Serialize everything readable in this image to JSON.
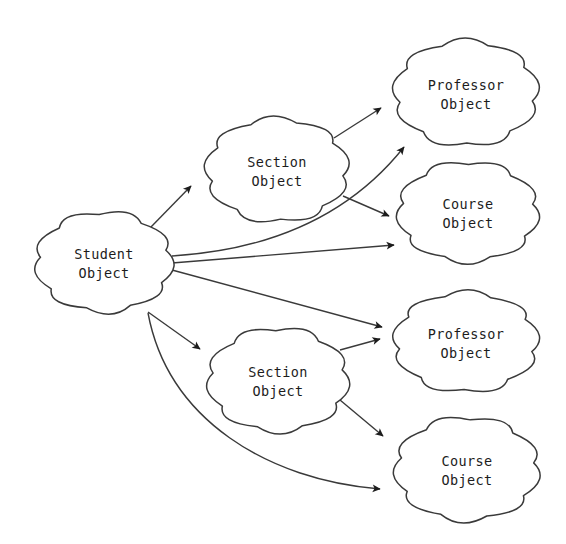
{
  "diagram": {
    "background_color": "#ffffff",
    "stroke_color": "#3a3a3a",
    "text_color": "#1c1c1c",
    "nodes": [
      {
        "id": "student",
        "line1": "Student",
        "line2": "Object",
        "cx": 104,
        "cy": 262,
        "rx": 76,
        "ry": 58
      },
      {
        "id": "section-top",
        "line1": "Section",
        "line2": "Object",
        "cx": 277,
        "cy": 170,
        "rx": 79,
        "ry": 60
      },
      {
        "id": "section-bottom",
        "line1": "Section",
        "line2": "Object",
        "cx": 278,
        "cy": 380,
        "rx": 78,
        "ry": 60
      },
      {
        "id": "professor-top",
        "line1": "Professor",
        "line2": "Object",
        "cx": 466,
        "cy": 93,
        "rx": 80,
        "ry": 61
      },
      {
        "id": "course-top",
        "line1": "Course",
        "line2": "Object",
        "cx": 468,
        "cy": 212,
        "rx": 78,
        "ry": 58
      },
      {
        "id": "professor-bottom",
        "line1": "Professor",
        "line2": "Object",
        "cx": 466,
        "cy": 342,
        "rx": 80,
        "ry": 58
      },
      {
        "id": "course-bottom",
        "line1": "Course",
        "line2": "Object",
        "cx": 467,
        "cy": 469,
        "rx": 80,
        "ry": 60
      }
    ],
    "edges": [
      {
        "id": "student-to-section-top",
        "from": "student",
        "to": "section-top",
        "shape": "straight",
        "path": "M 150,228 L 191,186"
      },
      {
        "id": "student-to-professor-top",
        "from": "student",
        "to": "professor-top",
        "shape": "curved",
        "path": "M 172,256 C 270,250 350,215 404,147"
      },
      {
        "id": "student-to-course-top",
        "from": "student",
        "to": "course-top",
        "shape": "straight",
        "path": "M 172,263 L 394,245"
      },
      {
        "id": "student-to-professor-bottom",
        "from": "student",
        "to": "professor-bottom",
        "shape": "straight",
        "path": "M 172,270 L 382,327"
      },
      {
        "id": "student-to-section-bottom",
        "from": "student",
        "to": "section-bottom",
        "shape": "straight",
        "path": "M 148,312 L 200,349"
      },
      {
        "id": "student-to-course-bottom",
        "from": "student",
        "to": "course-bottom",
        "shape": "curved",
        "path": "M 148,313 C 168,420 268,480 380,489"
      },
      {
        "id": "section-top-to-professor-top",
        "from": "section-top",
        "to": "professor-top",
        "shape": "straight",
        "path": "M 334,138 L 381,108"
      },
      {
        "id": "section-top-to-course-top",
        "from": "section-top",
        "to": "course-top",
        "shape": "straight",
        "path": "M 343,196 L 389,216"
      },
      {
        "id": "section-bottom-to-professor-bottom",
        "from": "section-bottom",
        "to": "professor-bottom",
        "shape": "straight",
        "path": "M 340,350 L 380,339"
      },
      {
        "id": "section-bottom-to-course-bottom",
        "from": "section-bottom",
        "to": "course-bottom",
        "shape": "straight",
        "path": "M 340,400 L 383,436"
      }
    ]
  }
}
